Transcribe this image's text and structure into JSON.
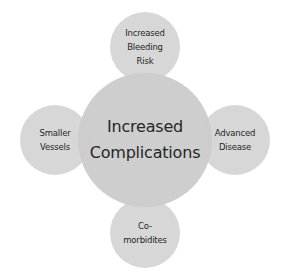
{
  "diagram": {
    "type": "radial-venn",
    "fill_color": "#c8c8c8",
    "overlap_color": "#b4b4b4",
    "text_color": "#262626",
    "center": {
      "lines": [
        "Increased",
        "Complications"
      ]
    },
    "satellites": [
      {
        "position": "top",
        "lines": [
          "Increased",
          "Bleeding",
          "Risk"
        ]
      },
      {
        "position": "left",
        "lines": [
          "Smaller",
          "Vessels"
        ]
      },
      {
        "position": "right",
        "lines": [
          "Advanced",
          "Disease"
        ]
      },
      {
        "position": "bottom",
        "lines": [
          "Co-",
          "morbidites"
        ]
      }
    ]
  }
}
